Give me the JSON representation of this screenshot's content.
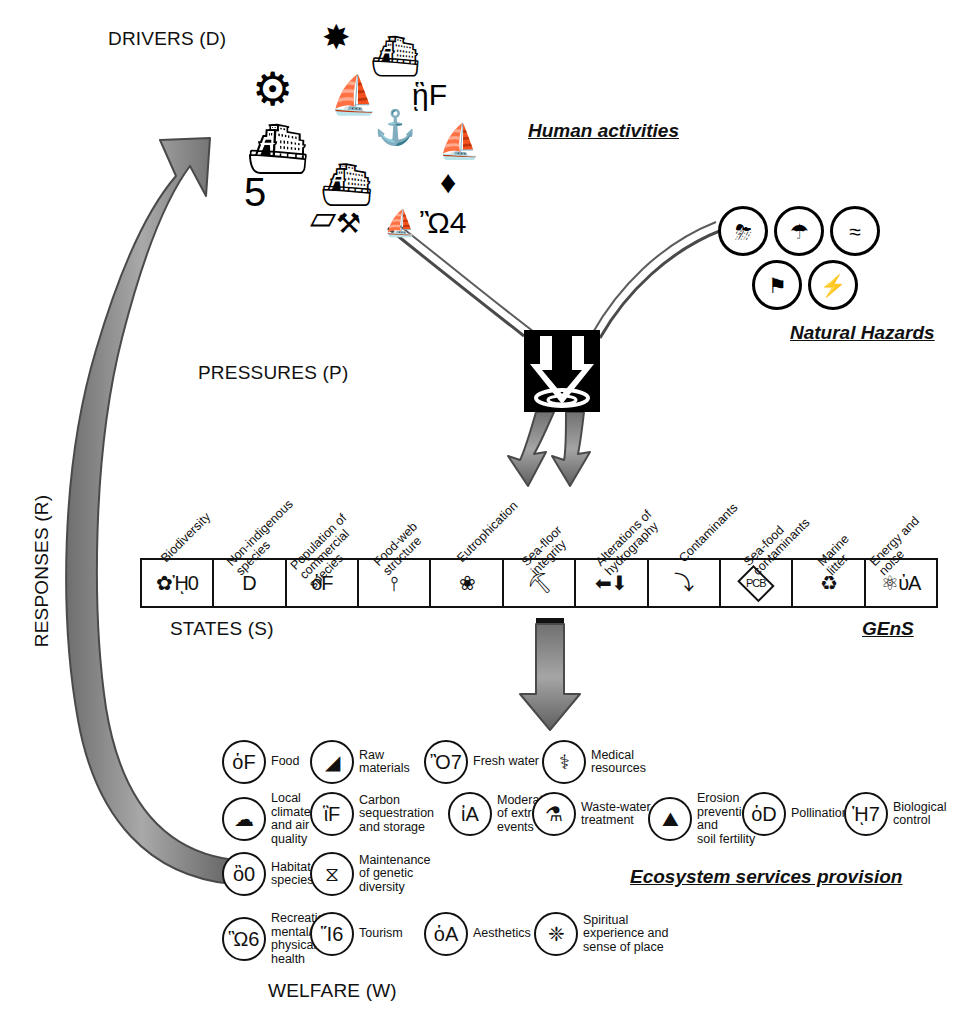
{
  "labels": {
    "drivers": "DRIVERS (D)",
    "pressures": "PRESSURES (P)",
    "states": "STATES (S)",
    "welfare": "WELFARE (W)",
    "responses": "RESPONSES (R)",
    "human_activities": "Human activities",
    "natural_hazards": "Natural Hazards",
    "gens": "GEnS",
    "ecosystem_services": "Ecosystem services provision"
  },
  "drivers_icons": [
    {
      "name": "oil-rig-icon",
      "glyph": "⚙",
      "x": 16,
      "y": 52,
      "size": 46
    },
    {
      "name": "wind-turbine-icon",
      "glyph": "✸",
      "x": 86,
      "y": 6,
      "size": 34
    },
    {
      "name": "dredger-ship-icon",
      "glyph": "⛴",
      "x": 134,
      "y": 22,
      "size": 40
    },
    {
      "name": "sailboat-icon",
      "glyph": "⛵",
      "x": 94,
      "y": 62,
      "size": 38
    },
    {
      "name": "scuba-diver-icon",
      "glyph": "ᾓF",
      "x": 176,
      "y": 66,
      "size": 30
    },
    {
      "name": "cargo-ship-icon",
      "glyph": "⚓",
      "x": 138,
      "y": 96,
      "size": 34
    },
    {
      "name": "cruise-ship-icon",
      "glyph": "⛴",
      "x": 10,
      "y": 110,
      "size": 50
    },
    {
      "name": "fishing-trawler-icon",
      "glyph": "⛴",
      "x": 84,
      "y": 150,
      "size": 42
    },
    {
      "name": "yacht-icon",
      "glyph": "⛵",
      "x": 202,
      "y": 110,
      "size": 34
    },
    {
      "name": "diamond-icon",
      "glyph": "♦",
      "x": 204,
      "y": 152,
      "size": 32
    },
    {
      "name": "crowd-people-icon",
      "glyph": "὆5",
      "x": 8,
      "y": 158,
      "size": 40
    },
    {
      "name": "pipeline-icon",
      "glyph": "▱",
      "x": 74,
      "y": 186,
      "size": 34
    },
    {
      "name": "aquaculture-icon",
      "glyph": "⚒",
      "x": 100,
      "y": 196,
      "size": 28
    },
    {
      "name": "windsurfer-icon",
      "glyph": "⛵",
      "x": 148,
      "y": 196,
      "size": 26
    },
    {
      "name": "jetski-icon",
      "glyph": "Ὢ4",
      "x": 184,
      "y": 194,
      "size": 30
    }
  ],
  "natural_hazards_icons": [
    {
      "name": "storm-rain-icon",
      "glyph": "⛈",
      "x": 718,
      "y": 206
    },
    {
      "name": "hail-storm-icon",
      "glyph": "☂",
      "x": 774,
      "y": 206
    },
    {
      "name": "waves-icon",
      "glyph": "≈",
      "x": 830,
      "y": 206
    },
    {
      "name": "windsock-icon",
      "glyph": "⚑",
      "x": 752,
      "y": 260
    },
    {
      "name": "lightning-icon",
      "glyph": "⚡",
      "x": 808,
      "y": 260
    }
  ],
  "states": [
    {
      "caption": "Biodiversity",
      "icon_name": "coral-crab-icon",
      "glyph": "✿ᾘ0",
      "cap_x": 168,
      "cap_y": 552
    },
    {
      "caption": "Non-indigenous\nspecies",
      "icon_name": "alien-species-icon",
      "glyph": "὇D",
      "cap_x": 243,
      "cap_y": 552
    },
    {
      "caption": "Population of\ncommercial\nspecies",
      "icon_name": "commercial-fish-icon",
      "glyph": "ὁF",
      "cap_x": 316,
      "cap_y": 552
    },
    {
      "caption": "Food-web\nstructure",
      "icon_name": "food-web-icon",
      "glyph": "⫯",
      "cap_x": 390,
      "cap_y": 552
    },
    {
      "caption": "Eutrophication",
      "icon_name": "eutrophication-icon",
      "glyph": "❀",
      "cap_x": 464,
      "cap_y": 552
    },
    {
      "caption": "Sea-floor\nintegrity",
      "icon_name": "sea-floor-dredge-icon",
      "glyph": "⛏",
      "cap_x": 538,
      "cap_y": 552
    },
    {
      "caption": "Alterations of\nhydrography",
      "icon_name": "hydrography-arrows-icon",
      "glyph": "⬅⬇",
      "cap_x": 612,
      "cap_y": 552
    },
    {
      "caption": "Contaminants",
      "icon_name": "contaminant-arrow-icon",
      "glyph": "⤵",
      "cap_x": 686,
      "cap_y": 552
    },
    {
      "caption": "Sea-food\ncontaminants",
      "icon_name": "pcb-diamond-icon",
      "glyph": "PCB",
      "cap_x": 760,
      "cap_y": 552
    },
    {
      "caption": "Marine\nlitter",
      "icon_name": "marine-litter-icon",
      "glyph": "♻",
      "cap_x": 834,
      "cap_y": 552
    },
    {
      "caption": "Energy and\nnoise",
      "icon_name": "energy-noise-icon",
      "glyph": "⚛ὐA",
      "cap_x": 886,
      "cap_y": 552
    }
  ],
  "ecosystem_services": [
    {
      "caption": "Food",
      "icon_name": "fish-food-icon",
      "glyph": "ὁF",
      "x": 222,
      "y": 740
    },
    {
      "caption": "Raw\nmaterials",
      "icon_name": "raw-materials-icon",
      "glyph": "◢",
      "x": 310,
      "y": 740
    },
    {
      "caption": "Fresh water",
      "icon_name": "fresh-water-icon",
      "glyph": "Ὂ7",
      "x": 424,
      "y": 740
    },
    {
      "caption": "Medical\nresources",
      "icon_name": "medical-caduceus-icon",
      "glyph": "⚕",
      "x": 542,
      "y": 740
    },
    {
      "caption": "Local\nclimate\nand air\nquality",
      "icon_name": "local-climate-icon",
      "glyph": "☁",
      "x": 222,
      "y": 792
    },
    {
      "caption": "Carbon\nsequestration\nand storage",
      "icon_name": "carbon-storage-icon",
      "glyph": "ἳF",
      "x": 310,
      "y": 792
    },
    {
      "caption": "Moderation\nof extreme\nevents",
      "icon_name": "extreme-events-icon",
      "glyph": "ἰA",
      "x": 448,
      "y": 792
    },
    {
      "caption": "Waste-water\ntreatment",
      "icon_name": "waste-water-icon",
      "glyph": "⚗",
      "x": 532,
      "y": 792
    },
    {
      "caption": "Erosion\nprevention\nand\nsoil fertility",
      "icon_name": "erosion-prevention-icon",
      "glyph": "⛰",
      "x": 648,
      "y": 792
    },
    {
      "caption": "Pollination",
      "icon_name": "pollination-icon",
      "glyph": "ὁD",
      "x": 742,
      "y": 792
    },
    {
      "caption": "Biological\ncontrol",
      "icon_name": "biological-control-icon",
      "glyph": "ᾙ7",
      "x": 844,
      "y": 792
    },
    {
      "caption": "Habitat for\nspecies",
      "icon_name": "habitat-species-icon",
      "glyph": "ὂ0",
      "x": 222,
      "y": 852
    },
    {
      "caption": "Maintenance\nof genetic\ndiversity",
      "icon_name": "genetic-diversity-icon",
      "glyph": "⧖",
      "x": 310,
      "y": 852
    },
    {
      "caption": "Recreation\nmental/\nphysical\nhealth",
      "icon_name": "recreation-health-icon",
      "glyph": "Ὣ6",
      "x": 222,
      "y": 912
    },
    {
      "caption": "Tourism",
      "icon_name": "tourism-icon",
      "glyph": "Ἵ6",
      "x": 310,
      "y": 912
    },
    {
      "caption": "Aesthetics",
      "icon_name": "aesthetics-spiral-icon",
      "glyph": "ὁA",
      "x": 424,
      "y": 912
    },
    {
      "caption": "Spiritual\nexperience and\nsense of place",
      "icon_name": "spiritual-icon",
      "glyph": "❈",
      "x": 534,
      "y": 912
    }
  ],
  "colors": {
    "ink": "#111111",
    "arrow_fill": "#8f8f8f",
    "arrow_stroke": "#3d3d3d",
    "background": "#ffffff"
  }
}
